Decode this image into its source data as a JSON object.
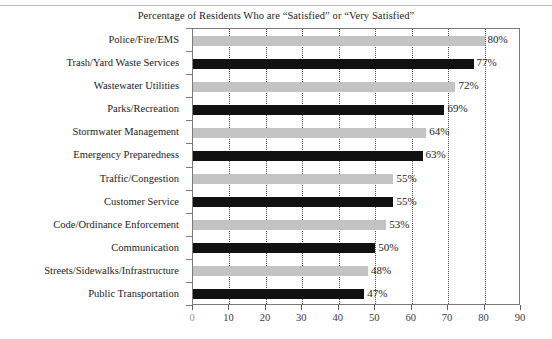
{
  "chart_data": {
    "type": "bar",
    "orientation": "horizontal",
    "title": "Percentage of Residents Who are “Satisfied” or “Very Satisfied”",
    "xlabel": "",
    "ylabel": "",
    "xlim": [
      0,
      90
    ],
    "xticks": [
      0,
      10,
      20,
      30,
      40,
      50,
      60,
      70,
      80,
      90
    ],
    "xtick_labels": [
      "0",
      "10",
      "20",
      "30",
      "40",
      "50",
      "60",
      "70",
      "80",
      "90"
    ],
    "grid": "vertical dotted gridlines at each x tick",
    "legend": "none",
    "value_label_suffix": "%",
    "colors": {
      "gray_bar": "#c3c3c3",
      "black_bar": "#111111",
      "frame": "#7a7a7a",
      "gridline": "#4d4d4d",
      "text": "#1c1c1c"
    },
    "categories": [
      "Police/Fire/EMS",
      "Trash/Yard Waste Services",
      "Wastewater Utilities",
      "Parks/Recreation",
      "Stormwater Management",
      "Emergency Preparedness",
      "Traffic/Congestion",
      "Customer Service",
      "Code/Ordinance Enforcement",
      "Communication",
      "Streets/Sidewalks/Infrastructure",
      "Public Transportation"
    ],
    "values": [
      80,
      77,
      72,
      69,
      64,
      63,
      55,
      55,
      53,
      50,
      48,
      47
    ],
    "value_labels": [
      "80%",
      "77%",
      "72%",
      "69%",
      "64%",
      "63%",
      "55%",
      "55%",
      "53%",
      "50%",
      "48%",
      "47%"
    ],
    "bar_colors": [
      "gray",
      "black",
      "gray",
      "black",
      "gray",
      "black",
      "gray",
      "black",
      "gray",
      "black",
      "gray",
      "black"
    ],
    "bars": [
      {
        "category": "Police/Fire/EMS",
        "value": 80,
        "label": "80%",
        "color": "gray"
      },
      {
        "category": "Trash/Yard Waste Services",
        "value": 77,
        "label": "77%",
        "color": "black"
      },
      {
        "category": "Wastewater Utilities",
        "value": 72,
        "label": "72%",
        "color": "gray"
      },
      {
        "category": "Parks/Recreation",
        "value": 69,
        "label": "69%",
        "color": "black"
      },
      {
        "category": "Stormwater Management",
        "value": 64,
        "label": "64%",
        "color": "gray"
      },
      {
        "category": "Emergency Preparedness",
        "value": 63,
        "label": "63%",
        "color": "black"
      },
      {
        "category": "Traffic/Congestion",
        "value": 55,
        "label": "55%",
        "color": "gray"
      },
      {
        "category": "Customer Service",
        "value": 55,
        "label": "55%",
        "color": "black"
      },
      {
        "category": "Code/Ordinance Enforcement",
        "value": 53,
        "label": "53%",
        "color": "gray"
      },
      {
        "category": "Communication",
        "value": 50,
        "label": "50%",
        "color": "black"
      },
      {
        "category": "Streets/Sidewalks/Infrastructure",
        "value": 48,
        "label": "48%",
        "color": "gray"
      },
      {
        "category": "Public Transportation",
        "value": 47,
        "label": "47%",
        "color": "black"
      }
    ]
  }
}
